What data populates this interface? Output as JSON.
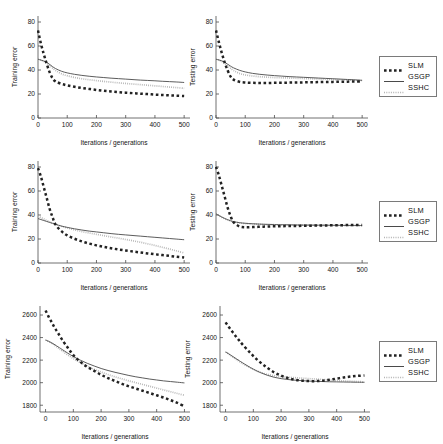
{
  "figure": {
    "axis_color": "#4d4d4d",
    "background": "#ffffff",
    "series_styles": {
      "SLM": {
        "color": "#222222",
        "style": "dotted-thick"
      },
      "GSGP": {
        "color": "#4a4a4a",
        "style": "solid"
      },
      "SSHC": {
        "color": "#b4b4b4",
        "style": "dotted-thin"
      }
    }
  },
  "legends": [
    {
      "name": "legend-row-1",
      "entries": [
        {
          "label": "SLM",
          "key": "dotted-thick"
        },
        {
          "label": "GSGP",
          "key": "solid"
        },
        {
          "label": "SSHC",
          "key": "dotted-thin"
        }
      ]
    },
    {
      "name": "legend-row-2",
      "entries": [
        {
          "label": "SLM",
          "key": "dotted-thick"
        },
        {
          "label": "GSGP",
          "key": "solid"
        },
        {
          "label": "SSHC",
          "key": "dotted-thin"
        }
      ]
    },
    {
      "name": "legend-row-3",
      "entries": [
        {
          "label": "SLM",
          "key": "dotted-thick"
        },
        {
          "label": "GSGP",
          "key": "solid"
        },
        {
          "label": "SSHC",
          "key": "dotted-thin"
        }
      ]
    }
  ],
  "chart_data": [
    {
      "id": "chart-r1c1",
      "type": "line",
      "title": "",
      "xlabel": "Iterations / generations",
      "ylabel": "Training error",
      "xlim": [
        0,
        520
      ],
      "ylim": [
        0,
        85
      ],
      "xticks": [
        0,
        100,
        200,
        300,
        400,
        500
      ],
      "yticks": [
        0,
        20,
        40,
        60,
        80
      ],
      "xticklabels": [
        "0",
        "100",
        "200",
        "300",
        "400",
        "500"
      ],
      "yticklabels": [
        "0",
        "20",
        "40",
        "60",
        "80"
      ],
      "grid": false,
      "legend": "right-outside",
      "x": [
        0,
        10,
        20,
        30,
        40,
        50,
        60,
        80,
        100,
        125,
        150,
        175,
        200,
        225,
        250,
        275,
        300,
        325,
        350,
        375,
        400,
        425,
        450,
        475,
        500
      ],
      "series": [
        {
          "name": "SLM",
          "values": [
            73,
            62,
            53,
            45,
            38,
            33,
            30.5,
            28.5,
            27.2,
            26.0,
            25.0,
            24.2,
            23.4,
            22.7,
            22.1,
            21.6,
            21.1,
            20.7,
            20.3,
            19.9,
            19.5,
            19.2,
            18.9,
            18.6,
            18.3
          ]
        },
        {
          "name": "GSGP",
          "values": [
            49,
            48.3,
            47.5,
            46.3,
            44.6,
            42.8,
            41.2,
            39.0,
            37.6,
            36.4,
            35.5,
            34.8,
            34.2,
            33.7,
            33.2,
            32.8,
            32.4,
            32.0,
            31.6,
            31.3,
            31.0,
            30.6,
            30.3,
            30.0,
            29.6
          ]
        },
        {
          "name": "SSHC",
          "values": [
            49,
            48.2,
            47.2,
            45.8,
            43.8,
            41.6,
            39.6,
            36.9,
            35.2,
            33.8,
            32.7,
            31.9,
            31.2,
            30.5,
            29.9,
            29.3,
            28.8,
            28.3,
            27.8,
            27.3,
            26.8,
            26.3,
            25.8,
            25.3,
            24.7
          ]
        }
      ]
    },
    {
      "id": "chart-r1c2",
      "type": "line",
      "title": "",
      "xlabel": "Iterations / generations",
      "ylabel": "Testing error",
      "xlim": [
        0,
        520
      ],
      "ylim": [
        0,
        85
      ],
      "xticks": [
        0,
        100,
        200,
        300,
        400,
        500
      ],
      "yticks": [
        0,
        20,
        40,
        60,
        80
      ],
      "xticklabels": [
        "0",
        "100",
        "200",
        "300",
        "400",
        "500"
      ],
      "yticklabels": [
        "0",
        "20",
        "40",
        "60",
        "80"
      ],
      "grid": false,
      "legend": "right-outside",
      "x": [
        0,
        10,
        20,
        30,
        40,
        50,
        60,
        80,
        100,
        125,
        150,
        175,
        200,
        225,
        250,
        275,
        300,
        325,
        350,
        375,
        400,
        425,
        450,
        475,
        500
      ],
      "series": [
        {
          "name": "SLM",
          "values": [
            73,
            63,
            54,
            46,
            39.5,
            34.5,
            32.0,
            30.2,
            29.6,
            29.3,
            29.2,
            29.2,
            29.3,
            29.4,
            29.5,
            29.6,
            29.7,
            29.8,
            29.9,
            30.0,
            30.1,
            30.2,
            30.3,
            30.4,
            30.5
          ]
        },
        {
          "name": "GSGP",
          "values": [
            49,
            48.4,
            47.6,
            46.4,
            44.8,
            43.2,
            41.8,
            39.8,
            38.4,
            37.2,
            36.4,
            35.8,
            35.3,
            34.9,
            34.5,
            34.2,
            33.9,
            33.6,
            33.3,
            33.0,
            32.7,
            32.4,
            32.1,
            31.8,
            31.4
          ]
        },
        {
          "name": "SSHC",
          "values": [
            49,
            48.2,
            47.0,
            45.4,
            43.4,
            41.4,
            39.6,
            37.2,
            35.9,
            35.0,
            34.4,
            34.0,
            33.7,
            33.5,
            33.3,
            33.1,
            32.9,
            32.7,
            32.5,
            32.3,
            32.1,
            31.9,
            31.7,
            31.5,
            31.2
          ]
        }
      ]
    },
    {
      "id": "chart-r2c1",
      "type": "line",
      "title": "",
      "xlabel": "Iterations / generations",
      "ylabel": "Training error",
      "xlim": [
        0,
        520
      ],
      "ylim": [
        0,
        85
      ],
      "xticks": [
        0,
        100,
        200,
        300,
        400,
        500
      ],
      "yticks": [
        0,
        20,
        40,
        60,
        80
      ],
      "xticklabels": [
        "0",
        "100",
        "200",
        "300",
        "400",
        "500"
      ],
      "yticklabels": [
        "0",
        "20",
        "40",
        "60",
        "80"
      ],
      "grid": false,
      "legend": "right-outside",
      "x": [
        0,
        10,
        20,
        30,
        40,
        50,
        60,
        80,
        100,
        125,
        150,
        175,
        200,
        225,
        250,
        275,
        300,
        325,
        350,
        375,
        400,
        425,
        450,
        475,
        500
      ],
      "series": [
        {
          "name": "SLM",
          "values": [
            79,
            72,
            63,
            54,
            45,
            38,
            32,
            26.5,
            23.0,
            20.2,
            18.0,
            16.2,
            14.7,
            13.4,
            12.3,
            11.3,
            10.4,
            9.6,
            8.8,
            8.0,
            7.3,
            6.6,
            5.9,
            5.2,
            4.5
          ]
        },
        {
          "name": "GSGP",
          "values": [
            37,
            36.2,
            35.4,
            34.6,
            33.8,
            33.0,
            32.2,
            30.8,
            29.7,
            28.5,
            27.5,
            26.6,
            25.9,
            25.2,
            24.5,
            23.9,
            23.4,
            22.9,
            22.4,
            21.9,
            21.4,
            20.9,
            20.4,
            19.9,
            19.4
          ]
        },
        {
          "name": "SSHC",
          "values": [
            39,
            37.8,
            36.6,
            35.4,
            34.3,
            33.3,
            32.4,
            30.6,
            29.2,
            27.6,
            26.2,
            25.0,
            23.9,
            22.8,
            21.7,
            20.7,
            19.6,
            18.5,
            17.3,
            16.0,
            14.6,
            13.1,
            11.6,
            10.0,
            8.4
          ]
        }
      ]
    },
    {
      "id": "chart-r2c2",
      "type": "line",
      "title": "",
      "xlabel": "Iterations / generations",
      "ylabel": "Testing error",
      "xlim": [
        0,
        520
      ],
      "ylim": [
        0,
        85
      ],
      "xticks": [
        0,
        100,
        200,
        300,
        400,
        500
      ],
      "yticks": [
        0,
        20,
        40,
        60,
        80
      ],
      "xticklabels": [
        "0",
        "100",
        "200",
        "300",
        "400",
        "500"
      ],
      "yticklabels": [
        "0",
        "20",
        "40",
        "60",
        "80"
      ],
      "grid": false,
      "legend": "right-outside",
      "x": [
        0,
        10,
        20,
        30,
        40,
        50,
        60,
        80,
        100,
        125,
        150,
        175,
        200,
        225,
        250,
        275,
        300,
        325,
        350,
        375,
        400,
        425,
        450,
        475,
        500
      ],
      "series": [
        {
          "name": "SLM",
          "values": [
            80,
            73,
            64,
            55,
            46,
            39,
            34,
            30.5,
            29.8,
            29.9,
            30.2,
            30.4,
            30.6,
            30.7,
            30.8,
            30.9,
            31.0,
            31.1,
            31.2,
            31.3,
            31.4,
            31.5,
            31.6,
            31.6,
            31.7
          ]
        },
        {
          "name": "GSGP",
          "values": [
            41,
            39.6,
            38.3,
            37.1,
            36.1,
            35.2,
            34.5,
            33.6,
            33.1,
            32.7,
            32.4,
            32.2,
            32.0,
            31.9,
            31.8,
            31.7,
            31.6,
            31.6,
            31.5,
            31.5,
            31.4,
            31.4,
            31.3,
            31.3,
            31.2
          ]
        },
        {
          "name": "SSHC",
          "values": [
            41,
            39.4,
            38.0,
            36.8,
            35.8,
            35.0,
            34.3,
            33.4,
            32.9,
            32.5,
            32.2,
            32.0,
            31.9,
            31.8,
            31.7,
            31.6,
            31.5,
            31.5,
            31.4,
            31.4,
            31.3,
            31.3,
            31.2,
            31.2,
            31.1
          ]
        }
      ]
    },
    {
      "id": "chart-r3c1",
      "type": "line",
      "title": "",
      "xlabel": "Iterations / generations",
      "ylabel": "Training error",
      "xlim": [
        -20,
        520
      ],
      "ylim": [
        1740,
        2680
      ],
      "xticks": [
        0,
        100,
        200,
        300,
        400,
        500
      ],
      "yticks": [
        1800,
        2000,
        2200,
        2400,
        2600
      ],
      "xticklabels": [
        "0",
        "100",
        "200",
        "300",
        "400",
        "500"
      ],
      "yticklabels": [
        "1800",
        "2000",
        "2200",
        "2400",
        "2600"
      ],
      "grid": false,
      "legend": "right-outside",
      "x": [
        0,
        10,
        20,
        30,
        40,
        50,
        60,
        80,
        100,
        125,
        150,
        175,
        200,
        225,
        250,
        275,
        300,
        325,
        350,
        375,
        400,
        425,
        450,
        475,
        500
      ],
      "series": [
        {
          "name": "SLM",
          "values": [
            2640,
            2590,
            2545,
            2500,
            2460,
            2420,
            2380,
            2310,
            2245,
            2185,
            2140,
            2105,
            2070,
            2040,
            2015,
            1990,
            1968,
            1948,
            1928,
            1908,
            1888,
            1868,
            1845,
            1820,
            1790
          ]
        },
        {
          "name": "GSGP",
          "values": [
            2378,
            2368,
            2356,
            2342,
            2326,
            2310,
            2294,
            2262,
            2232,
            2200,
            2172,
            2148,
            2126,
            2108,
            2092,
            2078,
            2064,
            2052,
            2042,
            2032,
            2024,
            2016,
            2010,
            2004,
            1998
          ]
        },
        {
          "name": "SSHC",
          "values": [
            2378,
            2366,
            2352,
            2336,
            2318,
            2300,
            2282,
            2246,
            2214,
            2178,
            2146,
            2118,
            2094,
            2072,
            2052,
            2034,
            2016,
            2000,
            1984,
            1968,
            1952,
            1936,
            1920,
            1904,
            1888
          ]
        }
      ]
    },
    {
      "id": "chart-r3c2",
      "type": "line",
      "title": "",
      "xlabel": "Iterations / generations",
      "ylabel": "Testing error",
      "xlim": [
        -20,
        520
      ],
      "ylim": [
        1740,
        2680
      ],
      "xticks": [
        0,
        100,
        200,
        300,
        400,
        500
      ],
      "yticks": [
        1800,
        2000,
        2200,
        2400,
        2600
      ],
      "xticklabels": [
        "0",
        "100",
        "200",
        "300",
        "400",
        "500"
      ],
      "yticklabels": [
        "1800",
        "2000",
        "2200",
        "2400",
        "2600"
      ],
      "grid": false,
      "legend": "right-outside",
      "x": [
        0,
        10,
        20,
        30,
        40,
        50,
        60,
        80,
        100,
        125,
        150,
        175,
        200,
        225,
        250,
        275,
        300,
        325,
        350,
        375,
        400,
        425,
        450,
        475,
        500
      ],
      "series": [
        {
          "name": "SLM",
          "values": [
            2535,
            2500,
            2466,
            2434,
            2402,
            2372,
            2342,
            2288,
            2236,
            2180,
            2132,
            2092,
            2062,
            2040,
            2026,
            2018,
            2014,
            2014,
            2018,
            2026,
            2036,
            2046,
            2054,
            2060,
            2064
          ]
        },
        {
          "name": "GSGP",
          "values": [
            2272,
            2258,
            2242,
            2226,
            2210,
            2194,
            2178,
            2148,
            2120,
            2090,
            2066,
            2048,
            2036,
            2028,
            2022,
            2018,
            2014,
            2012,
            2010,
            2008,
            2007,
            2006,
            2005,
            2004,
            2003
          ]
        },
        {
          "name": "SSHC",
          "values": [
            2272,
            2256,
            2238,
            2220,
            2204,
            2188,
            2172,
            2144,
            2118,
            2092,
            2074,
            2062,
            2054,
            2048,
            2044,
            2040,
            2036,
            2032,
            2028,
            2024,
            2020,
            2016,
            2013,
            2010,
            2007
          ]
        }
      ]
    }
  ]
}
